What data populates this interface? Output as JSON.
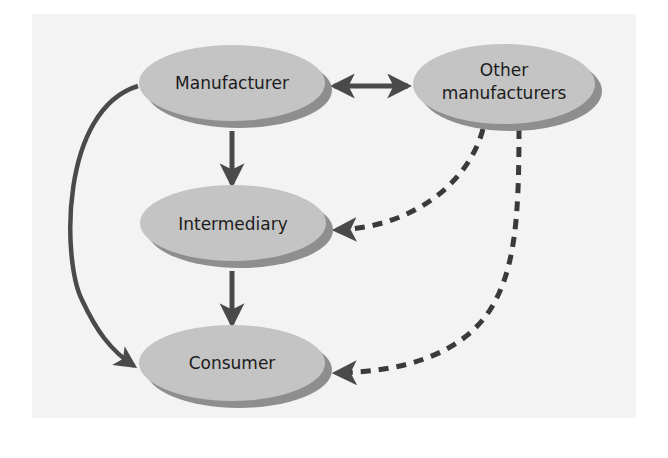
{
  "diagram": {
    "type": "flow",
    "colors": {
      "background": "#ffffff",
      "panel": "#f3f3f3",
      "node_fill": "#c4c4c4",
      "node_shadow": "#8e8e8e",
      "edge": "#4a4a4a",
      "text": "#1c1c1c"
    },
    "nodes": [
      {
        "id": "manufacturer",
        "label_lines": [
          "Manufacturer"
        ]
      },
      {
        "id": "other_manufacturers",
        "label_lines": [
          "Other",
          "manufacturers"
        ]
      },
      {
        "id": "intermediary",
        "label_lines": [
          "Intermediary"
        ]
      },
      {
        "id": "consumer",
        "label_lines": [
          "Consumer"
        ]
      }
    ],
    "edges": [
      {
        "from": "manufacturer",
        "to": "other_manufacturers",
        "style": "solid",
        "direction": "both"
      },
      {
        "from": "manufacturer",
        "to": "intermediary",
        "style": "solid",
        "direction": "forward"
      },
      {
        "from": "intermediary",
        "to": "consumer",
        "style": "solid",
        "direction": "forward"
      },
      {
        "from": "manufacturer",
        "to": "consumer",
        "style": "solid-curved",
        "direction": "forward"
      },
      {
        "from": "other_manufacturers",
        "to": "intermediary",
        "style": "dashed-curved",
        "direction": "forward"
      },
      {
        "from": "other_manufacturers",
        "to": "consumer",
        "style": "dashed-curved",
        "direction": "forward"
      }
    ]
  }
}
